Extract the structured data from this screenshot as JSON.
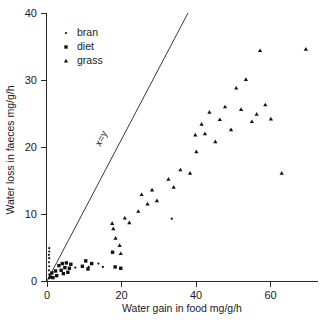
{
  "chart_data": {
    "type": "scatter",
    "title": "",
    "xlabel": "Water gain in food mg/g/h",
    "ylabel": "Water loss in faeces mg/g/h",
    "xlim": [
      0,
      72
    ],
    "ylim": [
      0,
      40
    ],
    "xticks": [
      0,
      20,
      40,
      60
    ],
    "yticks": [
      0,
      10,
      20,
      30,
      40
    ],
    "xticklabels": [
      "0",
      "20",
      "40",
      "60"
    ],
    "yticklabels": [
      "0",
      "10",
      "20",
      "30",
      "40"
    ],
    "grid": false,
    "legend_position": "top-left-inside",
    "annotations": [
      {
        "text": "x=y",
        "kind": "reference-line-label",
        "line": {
          "from": [
            0,
            0
          ],
          "to": [
            19,
            40
          ],
          "slope": 1
        }
      }
    ],
    "series": [
      {
        "name": "bran",
        "marker": "dot",
        "color": "#111111",
        "points": [
          [
            0.5,
            0.4
          ],
          [
            0.6,
            1.0
          ],
          [
            0.5,
            1.6
          ],
          [
            0.6,
            2.2
          ],
          [
            0.5,
            2.8
          ],
          [
            0.6,
            3.4
          ],
          [
            0.5,
            3.9
          ],
          [
            0.6,
            4.4
          ],
          [
            0.6,
            4.9
          ],
          [
            7.6,
            2.0
          ],
          [
            11.2,
            2.1
          ],
          [
            13.8,
            2.6
          ],
          [
            15.0,
            2.1
          ],
          [
            33.5,
            9.3
          ]
        ]
      },
      {
        "name": "diet",
        "marker": "square",
        "color": "#111111",
        "points": [
          [
            0.9,
            0.6
          ],
          [
            1.3,
            1.2
          ],
          [
            1.6,
            0.5
          ],
          [
            2.3,
            1.5
          ],
          [
            2.6,
            0.8
          ],
          [
            3.2,
            2.3
          ],
          [
            3.8,
            1.6
          ],
          [
            4.1,
            2.6
          ],
          [
            4.4,
            1.1
          ],
          [
            4.8,
            2.0
          ],
          [
            5.2,
            2.7
          ],
          [
            5.6,
            1.3
          ],
          [
            6.0,
            1.9
          ],
          [
            6.4,
            2.5
          ],
          [
            9.5,
            2.2
          ],
          [
            10.4,
            3.0
          ],
          [
            11.0,
            1.8
          ],
          [
            12.0,
            2.6
          ],
          [
            17.6,
            4.3
          ],
          [
            18.3,
            2.1
          ],
          [
            19.8,
            1.9
          ]
        ]
      },
      {
        "name": "grass",
        "marker": "triangle",
        "color": "#111111",
        "points": [
          [
            17.5,
            8.6
          ],
          [
            17.8,
            7.8
          ],
          [
            18.4,
            6.4
          ],
          [
            19.5,
            5.3
          ],
          [
            19.8,
            4.1
          ],
          [
            20.9,
            9.4
          ],
          [
            22.1,
            8.7
          ],
          [
            24.5,
            10.4
          ],
          [
            25.4,
            12.9
          ],
          [
            27.0,
            11.5
          ],
          [
            28.2,
            13.6
          ],
          [
            29.5,
            12.0
          ],
          [
            32.6,
            15.2
          ],
          [
            34.0,
            14.0
          ],
          [
            35.8,
            16.6
          ],
          [
            38.4,
            16.1
          ],
          [
            39.8,
            21.8
          ],
          [
            40.1,
            19.3
          ],
          [
            41.5,
            23.4
          ],
          [
            42.4,
            22.0
          ],
          [
            43.6,
            25.2
          ],
          [
            45.2,
            20.8
          ],
          [
            46.4,
            24.1
          ],
          [
            47.8,
            26.0
          ],
          [
            49.4,
            22.6
          ],
          [
            50.8,
            28.8
          ],
          [
            52.1,
            25.6
          ],
          [
            53.4,
            30.1
          ],
          [
            55.0,
            23.8
          ],
          [
            56.3,
            24.9
          ],
          [
            57.2,
            34.4
          ],
          [
            58.6,
            26.3
          ],
          [
            60.1,
            24.2
          ],
          [
            63.0,
            16.1
          ],
          [
            69.5,
            34.6
          ]
        ]
      }
    ]
  },
  "legend": {
    "items": [
      {
        "label": "bran",
        "marker": "dot"
      },
      {
        "label": "diet",
        "marker": "square"
      },
      {
        "label": "grass",
        "marker": "triangle"
      }
    ]
  }
}
